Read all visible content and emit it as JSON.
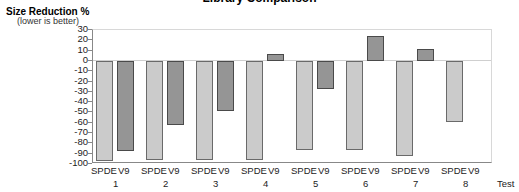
{
  "chart_data": {
    "type": "bar",
    "title": "Library Comparison",
    "ylabel": "Size Reduction %",
    "ylabel_sub": "(lower is better)",
    "xlabel": "Test",
    "ylim": [
      -100,
      30
    ],
    "yticks": [
      30,
      20,
      10,
      0,
      -10,
      -20,
      -30,
      -40,
      -50,
      -60,
      -70,
      -80,
      -90,
      -100
    ],
    "categories": [
      "1",
      "2",
      "3",
      "4",
      "5",
      "6",
      "7",
      "8"
    ],
    "series": [
      {
        "name": "SPDE",
        "color": "#cbcbcb",
        "values": [
          -97,
          -96,
          -96,
          -96,
          -86,
          -86,
          -92,
          -59
        ]
      },
      {
        "name": "V9",
        "color": "#959595",
        "values": [
          -87,
          -62,
          -49,
          7,
          -27,
          24,
          12,
          null
        ]
      }
    ],
    "grid": false,
    "legend": "none (series names shown under each bar)"
  }
}
